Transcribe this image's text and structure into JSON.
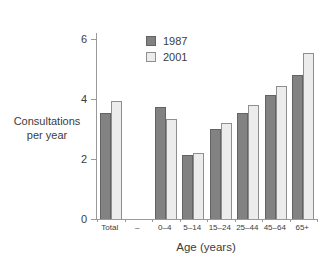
{
  "chart_data": {
    "type": "bar",
    "title": "",
    "categories": [
      "Total",
      "–",
      "0–4",
      "5–14",
      "15–24",
      "25–44",
      "45–64",
      "65+"
    ],
    "series": [
      {
        "name": "1987",
        "color": "#828282",
        "border_color": "#636363",
        "values": [
          3.55,
          null,
          3.75,
          2.15,
          3.0,
          3.55,
          4.15,
          4.8
        ]
      },
      {
        "name": "2001",
        "color": "#ececec",
        "border_color": "#8f8f8f",
        "values": [
          3.95,
          null,
          3.35,
          2.2,
          3.2,
          3.8,
          4.45,
          5.55
        ]
      }
    ],
    "xlabel": "Age (years)",
    "ylabel": "Consultations per year",
    "ylabel_lines": [
      "Consultations",
      "per year"
    ],
    "ylim": [
      0,
      6.2
    ],
    "yticks": [
      0,
      2,
      4,
      6
    ],
    "grid": false,
    "legend_position": "top-center-inside",
    "axis_color": "#9a9a9a",
    "text_color": "#3c3c3c",
    "background_color": "#ffffff"
  }
}
